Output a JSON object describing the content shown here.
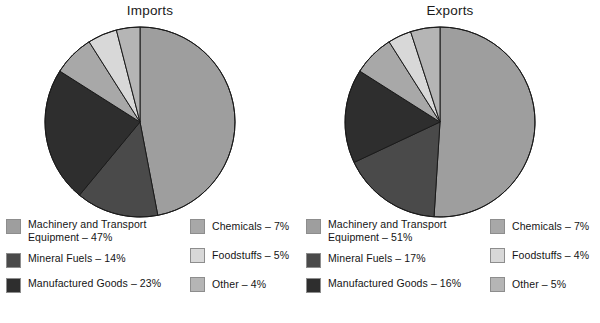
{
  "chart_data": [
    {
      "type": "pie",
      "title": "Imports",
      "labels": [
        "Machinery and Transport Equipment",
        "Mineral Fuels",
        "Manufactured Goods",
        "Chemicals",
        "Foodstuffs",
        "Other"
      ],
      "values": [
        47,
        14,
        23,
        7,
        5,
        4
      ],
      "value_unit": "%",
      "legend": [
        {
          "label": "Machinery and Transport\nEquipment – 47%",
          "color": "#9e9e9e",
          "value": 47
        },
        {
          "label": "Mineral Fuels – 14%",
          "color": "#4a4a4a",
          "value": 14
        },
        {
          "label": "Manufactured Goods – 23%",
          "color": "#2e2e2e",
          "value": 23
        },
        {
          "label": "Chemicals – 7%",
          "color": "#a8a8a8",
          "value": 7
        },
        {
          "label": "Foodstuffs – 5%",
          "color": "#d8d8d8",
          "value": 5
        },
        {
          "label": "Other – 4%",
          "color": "#b5b5b5",
          "value": 4
        }
      ],
      "colors": [
        "#9e9e9e",
        "#4a4a4a",
        "#2e2e2e",
        "#a8a8a8",
        "#d8d8d8",
        "#b5b5b5"
      ],
      "start_angle_deg": 0,
      "direction": "clockwise",
      "legend_position": "bottom"
    },
    {
      "type": "pie",
      "title": "Exports",
      "labels": [
        "Machinery and Transport Equipment",
        "Mineral Fuels",
        "Manufactured Goods",
        "Chemicals",
        "Foodstuffs",
        "Other"
      ],
      "values": [
        51,
        17,
        16,
        7,
        4,
        5
      ],
      "value_unit": "%",
      "legend": [
        {
          "label": "Machinery and Transport\nEquipment – 51%",
          "color": "#9e9e9e",
          "value": 51
        },
        {
          "label": "Mineral Fuels – 17%",
          "color": "#4a4a4a",
          "value": 17
        },
        {
          "label": "Manufactured Goods – 16%",
          "color": "#2e2e2e",
          "value": 16
        },
        {
          "label": "Chemicals – 7%",
          "color": "#a8a8a8",
          "value": 7
        },
        {
          "label": "Foodstuffs – 4%",
          "color": "#d8d8d8",
          "value": 4
        },
        {
          "label": "Other – 5%",
          "color": "#b5b5b5",
          "value": 5
        }
      ],
      "colors": [
        "#9e9e9e",
        "#4a4a4a",
        "#2e2e2e",
        "#a8a8a8",
        "#d8d8d8",
        "#b5b5b5"
      ],
      "start_angle_deg": 0,
      "direction": "clockwise",
      "legend_position": "bottom"
    }
  ],
  "style": {
    "background": "#ffffff",
    "slice_border": "#1a1a1a",
    "swatch_border": "#8d8d8d",
    "text": "#141414"
  }
}
